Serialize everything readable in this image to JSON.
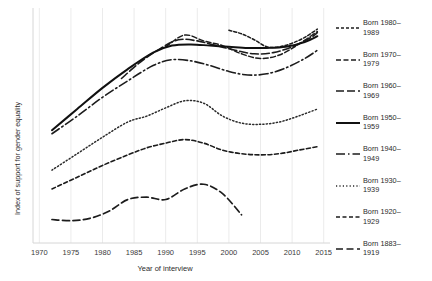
{
  "chart_data": {
    "type": "line",
    "title": "",
    "xlabel": "Year of interview",
    "ylabel": "Index of support for gender equality",
    "xlim": [
      1969,
      2016
    ],
    "ylim": [
      0,
      100
    ],
    "xticks": [
      1970,
      1975,
      1980,
      1985,
      1990,
      1995,
      2000,
      2005,
      2010,
      2015
    ],
    "xticklabels": [
      "1970",
      "1975",
      "1980",
      "1985",
      "1990",
      "1995",
      "2000",
      "2005",
      "2010",
      "2015"
    ],
    "yticks": [],
    "yticklabels": [],
    "grid": "vertical-only",
    "legend_position": "right",
    "series": [
      {
        "name": "Born 1980–1989",
        "label_line1": "Born 1980–",
        "label_line2": "1989",
        "dash": "3,2",
        "width": 1.5,
        "color": "#1c1c1c",
        "x": [
          2000,
          2002,
          2004,
          2006,
          2008,
          2010,
          2012,
          2014
        ],
        "y": [
          90.5,
          89.0,
          86.5,
          83.5,
          83.5,
          85.0,
          87.5,
          91.0
        ]
      },
      {
        "name": "Born 1970–1979",
        "label_line1": "Born 1970–",
        "label_line2": "1979",
        "dash": "5,2.5",
        "width": 1.5,
        "color": "#1c1c1c",
        "x": [
          1990,
          1993,
          1996,
          1999,
          2002,
          2005,
          2008,
          2011,
          2014
        ],
        "y": [
          83.5,
          88.5,
          86.0,
          84.0,
          80.5,
          78.5,
          80.0,
          84.5,
          90.0
        ]
      },
      {
        "name": "Born 1960–1969",
        "label_line1": "Born 1960–",
        "label_line2": "1969",
        "dash": "8,3",
        "width": 1.6,
        "color": "#1c1c1c",
        "x": [
          1983,
          1986,
          1989,
          1992,
          1995,
          1998,
          2001,
          2004,
          2007,
          2010,
          2013,
          2014
        ],
        "y": [
          70.0,
          77.0,
          82.5,
          86.5,
          86.0,
          84.0,
          82.0,
          80.5,
          81.0,
          83.5,
          87.5,
          89.5
        ]
      },
      {
        "name": "Born 1950–1959",
        "label_line1": "Born 1950–",
        "label_line2": "1959",
        "dash": "none",
        "width": 2.0,
        "color": "#111111",
        "x": [
          1972,
          1976,
          1980,
          1984,
          1988,
          1991,
          1994,
          1997,
          2000,
          2003,
          2006,
          2009,
          2012,
          2014
        ],
        "y": [
          48.0,
          57.0,
          66.0,
          74.0,
          81.0,
          84.0,
          84.5,
          84.0,
          83.5,
          83.0,
          83.0,
          83.5,
          85.5,
          88.0
        ]
      },
      {
        "name": "Born 1940–1949",
        "label_line1": "Born 1940–",
        "label_line2": "1949",
        "dash": "9,3,1.5,3",
        "width": 1.6,
        "color": "#1c1c1c",
        "x": [
          1972,
          1976,
          1980,
          1984,
          1988,
          1991,
          1994,
          1997,
          2000,
          2003,
          2006,
          2009,
          2012,
          2014
        ],
        "y": [
          46.5,
          54.0,
          62.0,
          69.0,
          75.5,
          78.0,
          77.5,
          75.5,
          73.0,
          71.5,
          72.0,
          74.5,
          78.5,
          82.0
        ]
      },
      {
        "name": "Born 1930–1939",
        "label_line1": "Born 1930–",
        "label_line2": "1939",
        "dash": "1.2,2.2",
        "width": 1.5,
        "color": "#2a2a2a",
        "x": [
          1972,
          1976,
          1980,
          1984,
          1987,
          1990,
          1993,
          1996,
          1999,
          2002,
          2005,
          2008,
          2011,
          2014
        ],
        "y": [
          31.0,
          38.0,
          45.0,
          51.5,
          54.0,
          57.5,
          60.5,
          59.5,
          54.0,
          51.0,
          50.5,
          51.5,
          54.0,
          57.0
        ]
      },
      {
        "name": "Born 1920–1929",
        "label_line1": "Born 1920–",
        "label_line2": "1929",
        "dash": "4,2.5",
        "width": 1.6,
        "color": "#1c1c1c",
        "x": [
          1972,
          1976,
          1980,
          1984,
          1987,
          1990,
          1993,
          1996,
          1999,
          2002,
          2005,
          2008,
          2011,
          2014
        ],
        "y": [
          23.0,
          28.0,
          33.0,
          37.5,
          40.5,
          42.5,
          44.0,
          42.5,
          39.5,
          38.0,
          37.5,
          38.0,
          39.5,
          41.0
        ]
      },
      {
        "name": "Born 1883–1919",
        "label_line1": "Born 1883–",
        "label_line2": "1919",
        "dash": "7,3.5",
        "width": 1.7,
        "color": "#1c1c1c",
        "x": [
          1972,
          1975,
          1978,
          1981,
          1984,
          1987,
          1990,
          1993,
          1996,
          1999,
          2002
        ],
        "y": [
          10.0,
          9.5,
          10.5,
          13.5,
          18.5,
          19.5,
          18.5,
          23.0,
          25.0,
          21.0,
          12.0
        ]
      }
    ]
  },
  "legend": {
    "entries": [
      {
        "line1": "Born 1980–",
        "line2": "1989"
      },
      {
        "line1": "Born 1970–",
        "line2": "1979"
      },
      {
        "line1": "Born 1960–",
        "line2": "1969"
      },
      {
        "line1": "Born 1950–",
        "line2": "1959"
      },
      {
        "line1": "Born 1940–",
        "line2": "1949"
      },
      {
        "line1": "Born 1930–",
        "line2": "1939"
      },
      {
        "line1": "Born 1920–",
        "line2": "1929"
      },
      {
        "line1": "Born 1883–",
        "line2": "1919"
      }
    ]
  }
}
